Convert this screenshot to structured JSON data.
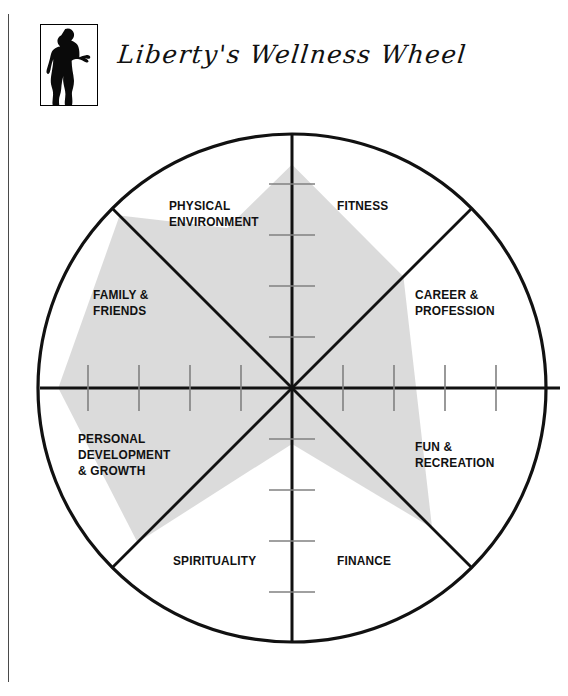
{
  "page": {
    "title": "Liberty's Wellness Wheel",
    "logo_icon": "woman-silhouette-icon"
  },
  "chart_data": {
    "type": "radar",
    "title": "Liberty's Wellness Wheel",
    "shape": "circle",
    "segments": 8,
    "scale_min": 0,
    "scale_max": 5,
    "ticks_per_axis": 4,
    "grid": "tick-marks-on-vertical-and-horizontal-axes",
    "legend": "none",
    "fill_color": "#d9d9d9",
    "line_color": "#000000",
    "categories": [
      "FITNESS",
      "CAREER &\nPROFESSION",
      "FUN &\nRECREATION",
      "FINANCE",
      "SPIRITUALITY",
      "PERSONAL\nDEVELOPMENT\n& GROWTH",
      "FAMILY &\nFRIENDS",
      "PHYSICAL\nENVIRONMENT"
    ],
    "values": [
      4.4,
      3.1,
      3.9,
      1.1,
      4.3,
      4.6,
      4.8,
      3.4
    ],
    "angles_deg": [
      90,
      45,
      315,
      270,
      225,
      180,
      135,
      112
    ],
    "axis_labels": {
      "fitness": "FITNESS",
      "career_profession": "CAREER & PROFESSION",
      "fun_recreation": "FUN & RECREATION",
      "finance": "FINANCE",
      "spirituality": "SPIRITUALITY",
      "personal_development": "PERSONAL DEVELOPMENT & GROWTH",
      "family_friends": "FAMILY & FRIENDS",
      "physical_environment": "PHYSICAL ENVIRONMENT"
    }
  },
  "labels": {
    "fitness": "FITNESS",
    "physical_environment": "PHYSICAL\nENVIRONMENT",
    "family_friends": "FAMILY &\nFRIENDS",
    "career_profession": "CAREER &\nPROFESSION",
    "personal_development": "PERSONAL\nDEVELOPMENT\n& GROWTH",
    "fun_recreation": "FUN &\nRECREATION",
    "spirituality": "SPIRITUALITY",
    "finance": "FINANCE"
  }
}
